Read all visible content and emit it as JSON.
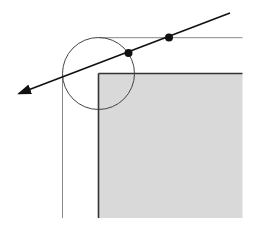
{
  "diagram": {
    "width": 255,
    "height": 230,
    "colors": {
      "background": "#ffffff",
      "rect_fill": "#d9d9d9",
      "rect_stroke": "#333333",
      "offset_line": "#888888",
      "circle_stroke": "#444444",
      "ray": "#111111",
      "dot": "#111111"
    },
    "rect": {
      "x": 98.5,
      "y": 73.5,
      "x2": 242.5,
      "y2": 218
    },
    "offset_boundary": {
      "horizontal": {
        "x1": 98.5,
        "y1": 37.7,
        "x2": 242.5,
        "y2": 37.7
      },
      "vertical": {
        "x1": 62.5,
        "y1": 73.5,
        "x2": 62.5,
        "y2": 218
      }
    },
    "circle": {
      "cx": 98.5,
      "cy": 73.5,
      "r": 36
    },
    "ray": {
      "x1": 230,
      "y1": 13,
      "x2": 15,
      "y2": 95
    },
    "points": [
      {
        "name": "intersection-offset-line",
        "cx": 169,
        "cy": 37.5,
        "r": 4
      },
      {
        "name": "intersection-circle",
        "cx": 128.5,
        "cy": 53,
        "r": 4
      }
    ]
  }
}
